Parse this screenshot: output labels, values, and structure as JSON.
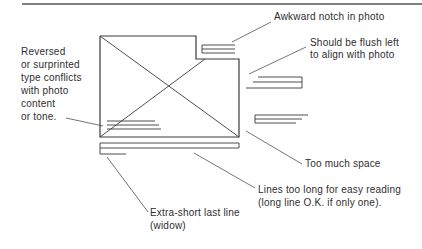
{
  "labels": {
    "notch": "Awkward notch in photo",
    "flush_line1": "Should be flush left",
    "flush_line2": "to align with photo",
    "reversed_line1": "Reversed",
    "reversed_line2": "or surprinted",
    "reversed_line3": "type conflicts",
    "reversed_line4": "with photo",
    "reversed_line5": "content",
    "reversed_line6": "or tone.",
    "space": "Too much space",
    "long_line1": "Lines too long for easy reading",
    "long_line2": "(long line O.K. if only one).",
    "widow_line1": "Extra-short last line",
    "widow_line2": "(widow)"
  },
  "colors": {
    "line": "#3a3a3a",
    "text": "#2e2e2e",
    "background": "#ffffff"
  }
}
